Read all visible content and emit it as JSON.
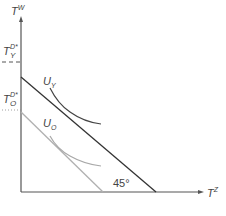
{
  "diagram": {
    "axes": {
      "y_label_base": "T",
      "y_label_sup": "W",
      "x_label_base": "T",
      "x_label_sup": "Z"
    },
    "y_ticks": [
      {
        "base": "T",
        "sup": "D*",
        "sub": "Y",
        "style": "dashed"
      },
      {
        "base": "T",
        "sup": "D*",
        "sub": "O",
        "style": "dotted"
      }
    ],
    "curves": {
      "young_label_base": "U",
      "young_label_sub": "Y",
      "old_label_base": "U",
      "old_label_sub": "O"
    },
    "angle_label": "45°",
    "colors": {
      "axis": "#555555",
      "budget_young": "#333333",
      "budget_old": "#b0b0b0",
      "indiff_young": "#444444",
      "indiff_old": "#a8a8a8",
      "text": "#444444"
    }
  }
}
